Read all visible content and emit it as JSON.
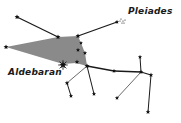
{
  "diagram": {
    "labels": {
      "pleiades": "Pleiades",
      "aldebaran": "Aldebaran"
    },
    "colors": {
      "line": "#1a1a1a",
      "thin_line": "#444444",
      "star": "#111111",
      "region_fill": "#8a8a8a"
    },
    "region": [
      [
        6,
        47
      ],
      [
        58,
        37
      ],
      [
        78,
        36
      ],
      [
        81,
        43
      ],
      [
        85,
        53
      ],
      [
        87,
        66
      ],
      [
        76,
        63
      ],
      [
        63,
        64
      ]
    ],
    "stars": [
      {
        "id": "s1",
        "x": 17,
        "y": 17,
        "r": 2.6
      },
      {
        "id": "s2",
        "x": 58,
        "y": 37,
        "r": 2.6
      },
      {
        "id": "s3",
        "x": 78,
        "y": 36,
        "r": 2.6
      },
      {
        "id": "s4",
        "x": 6,
        "y": 47,
        "r": 2.6
      },
      {
        "id": "pleiades",
        "x": 117,
        "y": 22,
        "r": 2.2
      },
      {
        "id": "s5",
        "x": 81,
        "y": 43,
        "r": 2.0
      },
      {
        "id": "s6",
        "x": 78,
        "y": 50,
        "r": 2.2
      },
      {
        "id": "s7",
        "x": 85,
        "y": 53,
        "r": 2.2
      },
      {
        "id": "s8",
        "x": 77,
        "y": 62,
        "r": 2.4
      },
      {
        "id": "aldebaran",
        "x": 63,
        "y": 65,
        "r": 3.6
      },
      {
        "id": "junction",
        "x": 87,
        "y": 66,
        "r": 2.6
      },
      {
        "id": "s9",
        "x": 114,
        "y": 71,
        "r": 2.2
      },
      {
        "id": "s10",
        "x": 141,
        "y": 72,
        "r": 2.4
      },
      {
        "id": "s11",
        "x": 151,
        "y": 75,
        "r": 2.4
      },
      {
        "id": "s12",
        "x": 140,
        "y": 57,
        "r": 2.2
      },
      {
        "id": "s13",
        "x": 67,
        "y": 83,
        "r": 2.4
      },
      {
        "id": "s14",
        "x": 71,
        "y": 96,
        "r": 2.2
      },
      {
        "id": "s15",
        "x": 94,
        "y": 94,
        "r": 2.2
      },
      {
        "id": "s16",
        "x": 117,
        "y": 98,
        "r": 2.2
      },
      {
        "id": "s17",
        "x": 148,
        "y": 112,
        "r": 2.4
      }
    ],
    "lines": [
      {
        "from": [
          17,
          17
        ],
        "to": [
          58,
          37
        ],
        "w": 1.3
      },
      {
        "from": [
          78,
          36
        ],
        "to": [
          117,
          22
        ],
        "w": 1.3
      },
      {
        "from": [
          87,
          66
        ],
        "to": [
          114,
          71
        ],
        "w": 1.3
      },
      {
        "from": [
          114,
          71
        ],
        "to": [
          141,
          72
        ],
        "w": 1.3
      },
      {
        "from": [
          141,
          72
        ],
        "to": [
          151,
          75
        ],
        "w": 1.3
      },
      {
        "from": [
          141,
          72
        ],
        "to": [
          140,
          57
        ],
        "w": 1.0
      },
      {
        "from": [
          151,
          75
        ],
        "to": [
          148,
          112
        ],
        "w": 1.0
      },
      {
        "from": [
          141,
          72
        ],
        "to": [
          117,
          98
        ],
        "w": 0.8
      },
      {
        "from": [
          87,
          66
        ],
        "to": [
          67,
          83
        ],
        "w": 0.8
      },
      {
        "from": [
          67,
          83
        ],
        "to": [
          71,
          96
        ],
        "w": 1.0
      },
      {
        "from": [
          87,
          66
        ],
        "to": [
          94,
          94
        ],
        "w": 1.0
      }
    ],
    "pleiades_dots": [
      [
        121,
        19
      ],
      [
        123,
        21
      ],
      [
        125,
        20
      ],
      [
        122,
        23
      ],
      [
        124,
        23
      ],
      [
        120,
        21
      ]
    ]
  }
}
